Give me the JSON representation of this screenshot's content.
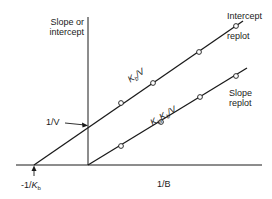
{
  "diagram": {
    "type": "replot",
    "colors": {
      "line": "#1a1a1a",
      "background": "#ffffff",
      "marker_fill": "#ffffff"
    },
    "y_axis": {
      "label_line1": "Slope or",
      "label_line2": "intercept"
    },
    "x_axis": {
      "label": "1/B"
    },
    "annotations": {
      "y_intercept": "1/V",
      "x_intercept_prefix": "-1/",
      "x_intercept_K": "K",
      "x_intercept_sub": "b"
    },
    "intercept_line": {
      "name_line1": "Intercept",
      "name_line2": "replot",
      "slope_label_K": "K",
      "slope_label_sub": "b",
      "slope_label_rest": "/V",
      "points": [
        [
          121,
          103
        ],
        [
          153,
          83
        ],
        [
          199,
          52
        ],
        [
          236,
          26
        ]
      ]
    },
    "slope_line": {
      "name_line1": "Slope",
      "name_line2": "replot",
      "slope_label_K1": "K",
      "slope_label_sub1": "ia",
      "slope_label_K2": "K",
      "slope_label_sub2": "b",
      "slope_label_rest": "/V",
      "points": [
        [
          121,
          146
        ],
        [
          161,
          122
        ],
        [
          200,
          97
        ],
        [
          236,
          76
        ]
      ]
    }
  }
}
